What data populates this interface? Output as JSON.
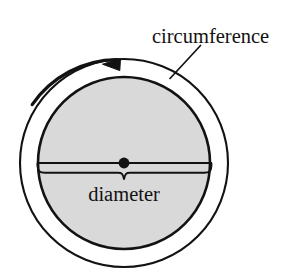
{
  "figure": {
    "title_alt": "Circle with labelled circumference and diameter",
    "background_color": "#ffffff",
    "stroke_color": "#121212",
    "fill_color": "#d9d9d9",
    "labels": {
      "circumference": "circumference",
      "diameter": "diameter"
    },
    "icons": {
      "arrowhead": "arrow-left-icon",
      "center_point": "center-dot-icon",
      "leader": "leader-line-icon",
      "brace": "curly-brace-icon"
    },
    "geometry": {
      "center_x": 124,
      "center_y": 163,
      "outer_circle_radius": 104,
      "inner_circle_radius": 86,
      "diameter_line_y": 163,
      "diameter_left_x": 37,
      "diameter_right_x": 212,
      "brace_y": 172,
      "brace_tip_y": 179,
      "arrow_tip_x": 103,
      "arrow_tip_y": 64
    }
  }
}
